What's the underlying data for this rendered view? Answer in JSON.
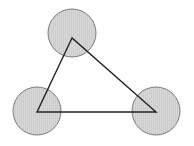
{
  "canvas": {
    "width": 194,
    "height": 146,
    "background_color": "#ffffff",
    "title": "Triangle with circles at vertices"
  },
  "style": {
    "triangle_stroke_color": "#222222",
    "triangle_stroke_width": 1.4,
    "triangle_fill": "none",
    "circle_stroke_color": "#7a7a7a",
    "circle_stroke_width": 1,
    "circle_fill_color": "#c9c9c9",
    "circle_hatch_color": "#d9d9d9",
    "circle_hatch_pattern": "vertical-lines",
    "circle_hatch_spacing": 2
  },
  "chart_data": {
    "type": "diagram",
    "xlabel": "",
    "ylabel": "",
    "xlim": [
      0,
      194
    ],
    "ylim": [
      0,
      146
    ],
    "grid": false,
    "legend": null,
    "shapes": [
      {
        "name": "triangle",
        "type": "polygon",
        "vertices": [
          [
            72,
            38
          ],
          [
            37,
            112
          ],
          [
            156,
            112
          ]
        ],
        "fill": "none",
        "stroke": "#222222"
      },
      {
        "name": "circle-top",
        "type": "circle",
        "cx": 72,
        "cy": 33,
        "r": 24,
        "fill": "#c9c9c9",
        "stroke": "#7a7a7a"
      },
      {
        "name": "circle-bottom-left",
        "type": "circle",
        "cx": 37,
        "cy": 111,
        "r": 24,
        "fill": "#c9c9c9",
        "stroke": "#7a7a7a"
      },
      {
        "name": "circle-bottom-right",
        "type": "circle",
        "cx": 156,
        "cy": 111,
        "r": 24,
        "fill": "#c9c9c9",
        "stroke": "#7a7a7a"
      }
    ],
    "annotations": []
  }
}
